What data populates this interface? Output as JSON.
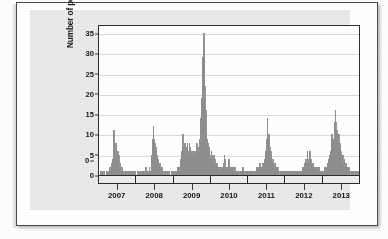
{
  "figure": {
    "panel_background": "#e9e9e7",
    "bar_color": "#9a9a9a"
  },
  "chart_data": {
    "type": "bar",
    "title": "",
    "subtitle": "",
    "xlabel": "",
    "ylabel": "Number of pediatric deaths",
    "ylim": [
      0,
      37
    ],
    "yticks": [
      0,
      5,
      10,
      15,
      20,
      25,
      30,
      35
    ],
    "ytick_labels": [
      "0",
      "5",
      "10",
      "15",
      "20",
      "25",
      "30",
      "35"
    ],
    "xtick_labels": [
      "2007",
      "2008",
      "2009",
      "2010",
      "2011",
      "2012",
      "2013"
    ],
    "xlim_note": "weekly surveillance weeks, mid-2006 through late 2013",
    "grid": "horizontal",
    "legend": "none",
    "annotations": [],
    "series_name": "Weekly influenza-associated pediatric deaths",
    "x": [
      0,
      1,
      2,
      3,
      4,
      5,
      6,
      7,
      8,
      9,
      10,
      11,
      12,
      13,
      14,
      15,
      16,
      17,
      18,
      19,
      20,
      21,
      22,
      23,
      24,
      25,
      26,
      27,
      28,
      29,
      30,
      31,
      32,
      33,
      34,
      35,
      36,
      37,
      38,
      39,
      40,
      41,
      42,
      43,
      44,
      45,
      46,
      47,
      48,
      49,
      50,
      51,
      52,
      53,
      54,
      55,
      56,
      57,
      58,
      59,
      60,
      61,
      62,
      63,
      64,
      65,
      66,
      67,
      68,
      69,
      70,
      71,
      72,
      73,
      74,
      75,
      76,
      77,
      78,
      79,
      80,
      81,
      82,
      83,
      84,
      85,
      86,
      87,
      88,
      89,
      90,
      91,
      92,
      93,
      94,
      95,
      96,
      97,
      98,
      99,
      100,
      101,
      102,
      103,
      104,
      105,
      106,
      107,
      108,
      109,
      110,
      111,
      112,
      113,
      114,
      115,
      116,
      117,
      118,
      119,
      120,
      121,
      122,
      123,
      124,
      125,
      126,
      127,
      128,
      129,
      130,
      131,
      132,
      133,
      134,
      135,
      136,
      137,
      138,
      139,
      140,
      141,
      142,
      143,
      144,
      145,
      146,
      147,
      148,
      149,
      150,
      151,
      152,
      153,
      154,
      155,
      156,
      157,
      158,
      159,
      160,
      161,
      162,
      163,
      164,
      165,
      166,
      167,
      168,
      169,
      170,
      171,
      172,
      173,
      174,
      175,
      176,
      177,
      178,
      179,
      180,
      181,
      182,
      183,
      184,
      185,
      186,
      187,
      188,
      189,
      190,
      191,
      192,
      193,
      194,
      195,
      196,
      197,
      198,
      199,
      200,
      201,
      202,
      203,
      204,
      205,
      206,
      207,
      208,
      209,
      210,
      211,
      212,
      213,
      214,
      215,
      216,
      217,
      218,
      219,
      220,
      221,
      222,
      223,
      224,
      225,
      226,
      227,
      228,
      229,
      230,
      231,
      232,
      233,
      234,
      235,
      236,
      237,
      238,
      239,
      240,
      241,
      242,
      243,
      244,
      245,
      246,
      247,
      248,
      249,
      250,
      251,
      252,
      253,
      254,
      255,
      256,
      257,
      258,
      259,
      260,
      261,
      262,
      263,
      264,
      265,
      266,
      267,
      268,
      269,
      270,
      271,
      272,
      273,
      274,
      275,
      276,
      277,
      278,
      279,
      280,
      281,
      282,
      283,
      284,
      285,
      286,
      287,
      288,
      289,
      290,
      291,
      292,
      293,
      294,
      295,
      296,
      297,
      298,
      299,
      300,
      301,
      302,
      303,
      304,
      305,
      306,
      307,
      308,
      309,
      310,
      311,
      312,
      313,
      314,
      315,
      316,
      317,
      318,
      319,
      320,
      321,
      322,
      323,
      324,
      325,
      326,
      327,
      328,
      329,
      330,
      331,
      332,
      333,
      334,
      335,
      336,
      337,
      338,
      339,
      340,
      341,
      342,
      343,
      344,
      345,
      346,
      347,
      348,
      349,
      350,
      351,
      352,
      353,
      354,
      355,
      356,
      357,
      358,
      359,
      360,
      361,
      362,
      363,
      364,
      365,
      366,
      367,
      368,
      369,
      370,
      371,
      372,
      373,
      374,
      375,
      376,
      377,
      378,
      379
    ],
    "values": [
      0,
      0,
      1,
      0,
      0,
      1,
      0,
      1,
      0,
      0,
      1,
      0,
      1,
      0,
      1,
      2,
      1,
      3,
      2,
      4,
      6,
      11,
      8,
      5,
      8,
      4,
      6,
      3,
      5,
      2,
      3,
      2,
      1,
      2,
      1,
      1,
      0,
      1,
      0,
      1,
      0,
      0,
      1,
      1,
      0,
      1,
      0,
      0,
      1,
      0,
      1,
      0,
      1,
      0,
      0,
      1,
      0,
      1,
      0,
      1,
      1,
      0,
      1,
      0,
      1,
      0,
      1,
      2,
      1,
      0,
      1,
      1,
      2,
      1,
      1,
      3,
      5,
      9,
      12,
      9,
      8,
      6,
      7,
      5,
      4,
      3,
      2,
      3,
      2,
      1,
      2,
      1,
      1,
      0,
      1,
      0,
      1,
      0,
      0,
      1,
      0,
      1,
      0,
      0,
      1,
      0,
      1,
      0,
      1,
      0,
      1,
      0,
      1,
      2,
      1,
      2,
      1,
      3,
      4,
      6,
      9,
      10,
      7,
      6,
      8,
      5,
      7,
      8,
      6,
      5,
      8,
      7,
      6,
      4,
      5,
      6,
      4,
      5,
      6,
      5,
      7,
      8,
      6,
      5,
      7,
      9,
      11,
      14,
      19,
      24,
      29,
      35,
      31,
      22,
      16,
      12,
      9,
      8,
      7,
      6,
      5,
      4,
      6,
      5,
      4,
      3,
      5,
      4,
      3,
      2,
      3,
      2,
      1,
      2,
      1,
      1,
      2,
      1,
      2,
      1,
      3,
      5,
      4,
      2,
      1,
      2,
      1,
      4,
      3,
      2,
      1,
      2,
      1,
      2,
      1,
      1,
      2,
      1,
      1,
      0,
      1,
      0,
      1,
      0,
      1,
      1,
      0,
      1,
      2,
      1,
      0,
      1,
      0,
      1,
      0,
      1,
      0,
      1,
      0,
      1,
      1,
      0,
      1,
      0,
      1,
      0,
      1,
      2,
      1,
      2,
      1,
      2,
      3,
      2,
      1,
      2,
      3,
      2,
      3,
      2,
      4,
      6,
      9,
      14,
      10,
      9,
      10,
      7,
      6,
      5,
      4,
      3,
      4,
      3,
      2,
      3,
      2,
      1,
      2,
      1,
      1,
      0,
      1,
      0,
      1,
      0,
      1,
      0,
      1,
      0,
      1,
      0,
      1,
      0,
      1,
      0,
      1,
      0,
      1,
      0,
      1,
      0,
      1,
      0,
      1,
      1,
      0,
      1,
      0,
      1,
      0,
      1,
      0,
      1,
      2,
      1,
      2,
      3,
      2,
      4,
      3,
      6,
      4,
      3,
      5,
      6,
      4,
      3,
      2,
      3,
      2,
      1,
      2,
      1,
      2,
      1,
      2,
      1,
      2,
      1,
      1,
      0,
      1,
      0,
      1,
      0,
      1,
      2,
      1,
      2,
      3,
      2,
      4,
      3,
      5,
      6,
      8,
      10,
      9,
      7,
      9,
      13,
      16,
      13,
      11,
      10,
      9,
      10,
      8,
      7,
      6,
      5,
      4,
      5,
      3,
      4,
      3,
      2,
      3,
      2,
      1,
      2,
      1,
      1,
      0,
      1,
      0,
      1,
      0,
      1,
      0,
      1,
      0,
      1,
      0,
      1,
      0,
      1,
      2,
      4
    ]
  }
}
